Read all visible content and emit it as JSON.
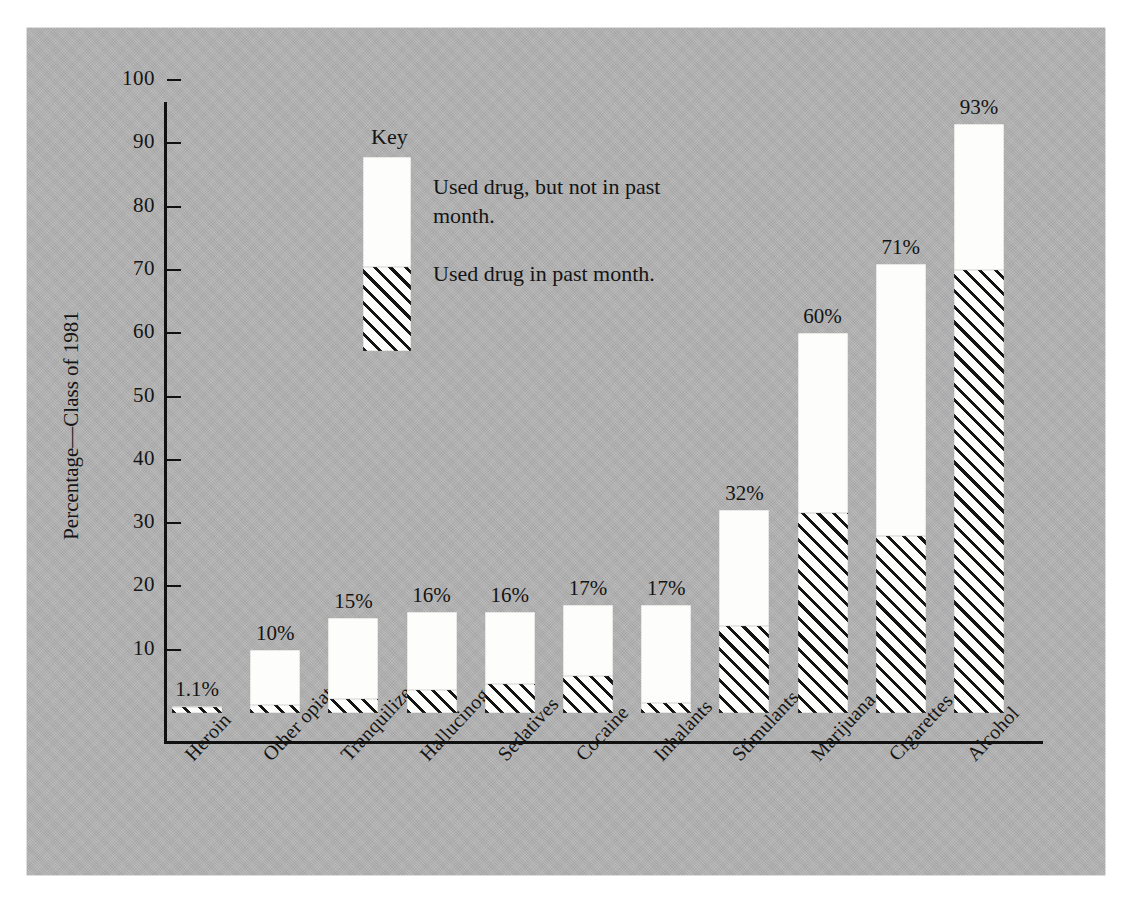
{
  "chart_data": {
    "type": "bar",
    "title": "",
    "subtitle": "",
    "xlabel": "",
    "ylabel": "Percentage—Class of 1981",
    "ylim": [
      0,
      100
    ],
    "yticks": [
      10,
      20,
      30,
      40,
      50,
      60,
      70,
      80,
      90,
      100
    ],
    "grid": false,
    "stacked": true,
    "legend_position": "inside-upper-left",
    "legend_title": "Key",
    "categories": [
      "Heroin",
      "Other opiates",
      "Tranquilizers",
      "Hallucinogens",
      "Sedatives",
      "Cocaine",
      "Inhalants",
      "Stimulants",
      "Marijuana",
      "Cigarettes",
      "Alcohol"
    ],
    "series": [
      {
        "name": "Used drug in past month.",
        "style": "hatched",
        "values": [
          1.0,
          1.2,
          2.2,
          3.7,
          4.6,
          5.8,
          1.5,
          13.8,
          31.6,
          28.0,
          70.0
        ]
      },
      {
        "name": "Used drug, but not in past month.",
        "style": "white",
        "values": [
          0.1,
          8.8,
          12.8,
          12.3,
          11.4,
          11.2,
          15.5,
          18.2,
          28.4,
          43.0,
          23.0
        ]
      }
    ],
    "totals": [
      1.1,
      10,
      15,
      16,
      16,
      17,
      17,
      32,
      60,
      71,
      93
    ],
    "data_labels": [
      "1.1%",
      "10%",
      "15%",
      "16%",
      "16%",
      "17%",
      "17%",
      "32%",
      "60%",
      "71%",
      "93%"
    ]
  },
  "legend": {
    "title": "Key",
    "item_white": "Used drug, but not in past month.",
    "item_hatched": "Used drug in past month."
  },
  "axis": {
    "y_title": "Percentage—Class of 1981",
    "y_tick_labels": [
      "100",
      "90",
      "80",
      "70",
      "60",
      "50",
      "40",
      "30",
      "20",
      "10"
    ]
  }
}
